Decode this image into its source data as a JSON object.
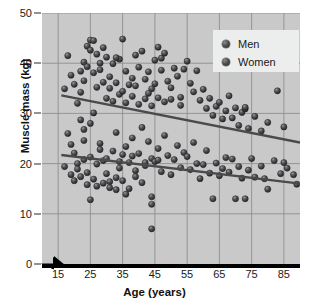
{
  "chart_data": {
    "type": "scatter",
    "title": "",
    "xlabel": "Age (years)",
    "ylabel": "Muscle mass (kg)",
    "xlim": [
      10,
      90
    ],
    "ylim": [
      0,
      50
    ],
    "xticks": [
      15,
      25,
      35,
      45,
      55,
      65,
      75,
      85
    ],
    "yticks": [
      0,
      10,
      20,
      30,
      40,
      50
    ],
    "grid": true,
    "axis_break": true,
    "legend_position": "top-right",
    "legend": [
      "Men",
      "Women"
    ],
    "colors": {
      "plot_background": "#c9c9c9",
      "gridline": "#8f8f8f",
      "marker": "#3d3d3d",
      "trendline": "#4a4a4a",
      "axis": "#000000",
      "legend_background": "#eceded"
    },
    "series": [
      {
        "name": "Men",
        "marker": "filled-circle",
        "trendline": {
          "x": [
            16,
            90
          ],
          "y": [
            33.6,
            24.2
          ]
        },
        "points": [
          [
            18,
            41.5
          ],
          [
            17,
            34.9
          ],
          [
            19,
            37.6
          ],
          [
            20,
            35.8
          ],
          [
            22,
            38.4
          ],
          [
            21,
            32.0
          ],
          [
            23,
            40.2
          ],
          [
            24,
            43.4
          ],
          [
            25,
            44.6
          ],
          [
            26,
            44.5
          ],
          [
            25,
            42.6
          ],
          [
            27,
            41.8
          ],
          [
            28,
            40.0
          ],
          [
            24,
            39.3
          ],
          [
            26,
            38.1
          ],
          [
            23,
            36.5
          ],
          [
            22,
            34.2
          ],
          [
            27,
            35.2
          ],
          [
            29,
            43.1
          ],
          [
            30,
            41.2
          ],
          [
            28,
            38.7
          ],
          [
            31,
            37.3
          ],
          [
            32,
            39.9
          ],
          [
            33,
            36.1
          ],
          [
            34,
            40.8
          ],
          [
            35,
            44.8
          ],
          [
            33,
            41.1
          ],
          [
            36,
            38.4
          ],
          [
            37,
            35.7
          ],
          [
            38,
            37.0
          ],
          [
            39,
            41.6
          ],
          [
            40,
            39.2
          ],
          [
            41,
            42.4
          ],
          [
            42,
            36.8
          ],
          [
            43,
            38.3
          ],
          [
            44,
            34.9
          ],
          [
            45,
            40.6
          ],
          [
            46,
            43.2
          ],
          [
            47,
            41.0
          ],
          [
            48,
            42.0
          ],
          [
            47,
            38.6
          ],
          [
            49,
            36.4
          ],
          [
            50,
            35.1
          ],
          [
            51,
            39.0
          ],
          [
            52,
            37.4
          ],
          [
            53,
            33.2
          ],
          [
            54,
            38.8
          ],
          [
            55,
            40.4
          ],
          [
            56,
            36.0
          ],
          [
            57,
            34.3
          ],
          [
            58,
            38.5
          ],
          [
            59,
            32.6
          ],
          [
            60,
            34.8
          ],
          [
            61,
            31.0
          ],
          [
            62,
            33.0
          ],
          [
            63,
            29.6
          ],
          [
            64,
            31.4
          ],
          [
            65,
            32.2
          ],
          [
            66,
            28.9
          ],
          [
            67,
            30.5
          ],
          [
            68,
            33.5
          ],
          [
            69,
            29.1
          ],
          [
            70,
            31.1
          ],
          [
            71,
            27.6
          ],
          [
            72,
            30.2
          ],
          [
            73,
            30.9
          ],
          [
            73,
            31.2
          ],
          [
            74,
            27.0
          ],
          [
            76,
            29.4
          ],
          [
            78,
            26.5
          ],
          [
            80,
            28.2
          ],
          [
            83,
            34.5
          ],
          [
            85,
            27.3
          ],
          [
            30,
            33.0
          ],
          [
            32,
            32.4
          ],
          [
            34,
            33.8
          ],
          [
            36,
            32.1
          ],
          [
            38,
            33.4
          ],
          [
            40,
            31.8
          ],
          [
            42,
            32.9
          ],
          [
            44,
            31.5
          ],
          [
            46,
            33.1
          ],
          [
            48,
            32.3
          ],
          [
            29,
            36.2
          ],
          [
            31,
            35.0
          ],
          [
            35,
            34.4
          ],
          [
            39,
            35.5
          ],
          [
            43,
            34.0
          ],
          [
            45,
            35.9
          ],
          [
            50,
            32.8
          ],
          [
            53,
            31.6
          ]
        ]
      },
      {
        "name": "Women",
        "marker": "filled-circle",
        "trendline": {
          "x": [
            16,
            90
          ],
          "y": [
            21.7,
            16.0
          ]
        },
        "points": [
          [
            18,
            26.0
          ],
          [
            17,
            19.4
          ],
          [
            19,
            23.8
          ],
          [
            20,
            22.1
          ],
          [
            21,
            20.0
          ],
          [
            22,
            28.7
          ],
          [
            23,
            24.6
          ],
          [
            24,
            18.2
          ],
          [
            25,
            21.3
          ],
          [
            26,
            16.9
          ],
          [
            24,
            15.8
          ],
          [
            27,
            19.9
          ],
          [
            28,
            22.8
          ],
          [
            23,
            26.8
          ],
          [
            26,
            30.1
          ],
          [
            25,
            28.0
          ],
          [
            22,
            17.4
          ],
          [
            29,
            20.6
          ],
          [
            30,
            18.0
          ],
          [
            28,
            24.0
          ],
          [
            31,
            16.4
          ],
          [
            32,
            22.5
          ],
          [
            33,
            26.2
          ],
          [
            34,
            19.1
          ],
          [
            35,
            21.8
          ],
          [
            33,
            17.2
          ],
          [
            36,
            23.4
          ],
          [
            37,
            20.2
          ],
          [
            38,
            25.1
          ],
          [
            39,
            18.6
          ],
          [
            40,
            22.0
          ],
          [
            41,
            27.2
          ],
          [
            42,
            19.6
          ],
          [
            43,
            24.4
          ],
          [
            44,
            21.0
          ],
          [
            44,
            13.4
          ],
          [
            44,
            11.9
          ],
          [
            44,
            7.0
          ],
          [
            45,
            20.4
          ],
          [
            46,
            23.0
          ],
          [
            47,
            18.4
          ],
          [
            48,
            25.6
          ],
          [
            49,
            21.6
          ],
          [
            50,
            17.8
          ],
          [
            51,
            20.8
          ],
          [
            52,
            23.6
          ],
          [
            53,
            19.2
          ],
          [
            54,
            22.2
          ],
          [
            55,
            21.4
          ],
          [
            56,
            18.8
          ],
          [
            57,
            24.2
          ],
          [
            58,
            20.0
          ],
          [
            59,
            17.0
          ],
          [
            60,
            19.8
          ],
          [
            61,
            22.6
          ],
          [
            62,
            18.1
          ],
          [
            63,
            13.0
          ],
          [
            64,
            20.1
          ],
          [
            65,
            17.6
          ],
          [
            66,
            19.0
          ],
          [
            67,
            21.2
          ],
          [
            68,
            18.3
          ],
          [
            69,
            20.9
          ],
          [
            70,
            13.0
          ],
          [
            71,
            19.4
          ],
          [
            72,
            17.1
          ],
          [
            73,
            13.0
          ],
          [
            74,
            18.7
          ],
          [
            75,
            21.0
          ],
          [
            76,
            17.3
          ],
          [
            78,
            19.5
          ],
          [
            79,
            17.0
          ],
          [
            80,
            14.9
          ],
          [
            82,
            20.6
          ],
          [
            84,
            18.0
          ],
          [
            85,
            20.2
          ],
          [
            86,
            19.1
          ],
          [
            88,
            17.8
          ],
          [
            89,
            15.9
          ],
          [
            27,
            15.5
          ],
          [
            29,
            16.1
          ],
          [
            31,
            15.2
          ],
          [
            25,
            12.8
          ],
          [
            33,
            14.8
          ],
          [
            35,
            16.6
          ],
          [
            37,
            15.0
          ],
          [
            39,
            17.4
          ],
          [
            41,
            16.2
          ],
          [
            30,
            21.0
          ],
          [
            34,
            20.4
          ],
          [
            38,
            21.5
          ],
          [
            42,
            20.2
          ],
          [
            46,
            20.7
          ],
          [
            20,
            16.6
          ],
          [
            19,
            17.8
          ],
          [
            21,
            18.9
          ],
          [
            23,
            20.8
          ],
          [
            36,
            13.9
          ]
        ]
      }
    ]
  },
  "axes": {
    "y_title": "Muscle mass (kg)",
    "x_title": "Age (years)",
    "y_tick_labels": [
      "0",
      "10",
      "20",
      "30",
      "40",
      "50"
    ],
    "x_tick_labels": [
      "15",
      "25",
      "35",
      "45",
      "55",
      "65",
      "75",
      "85"
    ]
  },
  "legend": {
    "items": [
      {
        "label": "Men"
      },
      {
        "label": "Women"
      }
    ]
  }
}
